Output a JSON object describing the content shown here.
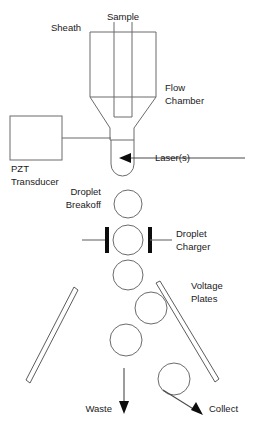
{
  "diagram": {
    "labels": {
      "sheath": "Sheath",
      "sample": "Sample",
      "flow_chamber_line1": "Flow",
      "flow_chamber_line2": "Chamber",
      "pzt_line1": "PZT",
      "pzt_line2": "Transducer",
      "lasers": "Laser(s)",
      "droplet_breakoff_line1": "Droplet",
      "droplet_breakoff_line2": "Breakoff",
      "droplet_charger_line1": "Droplet",
      "droplet_charger_line2": "Charger",
      "voltage_plates_line1": "Voltage",
      "voltage_plates_line2": "Plates",
      "waste": "Waste",
      "collect": "Collect"
    },
    "colors": {
      "background": "#ffffff",
      "outline": "#6b6b6b",
      "text": "#1a1a1a",
      "charger_bar": "#0d0d0d",
      "arrow": "#4a4a4a"
    },
    "droplets": [
      {
        "name": "droplet-breakoff",
        "cx": 128,
        "cy": 204,
        "r": 14
      },
      {
        "name": "droplet-in-charger",
        "cx": 128,
        "cy": 240,
        "r": 15
      },
      {
        "name": "droplet-undeflected-1",
        "cx": 128,
        "cy": 275,
        "r": 15
      },
      {
        "name": "droplet-deflected-right-1",
        "cx": 151,
        "cy": 308,
        "r": 16
      },
      {
        "name": "droplet-undeflected-2",
        "cx": 126,
        "cy": 340,
        "r": 16
      },
      {
        "name": "droplet-deflected-right-2",
        "cx": 174,
        "cy": 379,
        "r": 16
      }
    ],
    "charger": {
      "left_bar_x": 105,
      "right_bar_x": 148,
      "bar_y": 227,
      "bar_width": 4,
      "bar_height": 26,
      "left_lead_from": 82,
      "right_lead_to": 172
    },
    "flow_chamber": {
      "body_left": 90,
      "body_right": 156,
      "body_top": 32,
      "body_bottom": 97,
      "neck_left": 110,
      "neck_right": 134,
      "neck_bottom": 140
    },
    "sample_tube": {
      "left": 114,
      "right": 132,
      "top": 22,
      "bottom": 117
    },
    "pzt_box": {
      "left": 10,
      "top": 116,
      "width": 52,
      "height": 44
    },
    "nozzle": {
      "left": 111,
      "right": 134,
      "top": 140,
      "bottom": 176
    },
    "voltage_plates": [
      {
        "name": "voltage-plate-left",
        "x1": 74,
        "y1": 287,
        "x2": 26,
        "y2": 380
      },
      {
        "name": "voltage-plate-right",
        "x1": 156,
        "y1": 283,
        "x2": 219,
        "y2": 382
      }
    ],
    "outputs": [
      {
        "name": "waste-arrow",
        "x1": 124,
        "y1": 368,
        "x2": 124,
        "y2": 412
      },
      {
        "name": "collect-arrow",
        "x1": 163,
        "y1": 390,
        "x2": 199,
        "y2": 413
      }
    ]
  }
}
